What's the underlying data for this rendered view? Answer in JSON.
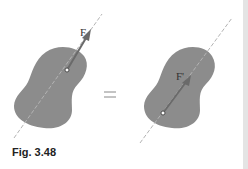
{
  "figure": {
    "caption": "Fig. 3.48",
    "left_force_label": "F",
    "right_force_label": "F'",
    "equals": "="
  },
  "colors": {
    "body_fill": "#8c8c8c",
    "line_of_action": "#b0b0b0",
    "arrow": "#6e6e6e"
  }
}
